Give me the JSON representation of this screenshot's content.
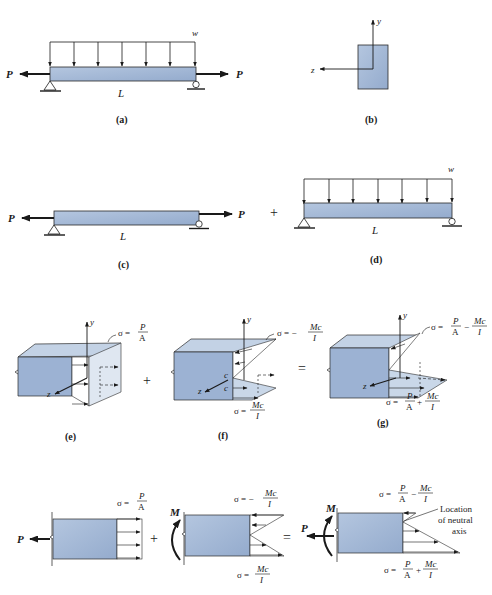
{
  "colors": {
    "beam_fill": "#a9bedb",
    "beam_stroke": "#2a2a2a",
    "face_fill": "#d6e1ee",
    "front_fill": "#9cb2d3",
    "top_fill": "#c3d2e5",
    "line": "#1a1a1a",
    "background": "#ffffff"
  },
  "panels": {
    "a": {
      "caption": "(a)",
      "load_label": "w",
      "force_left": "P",
      "force_right": "P",
      "length_label": "L"
    },
    "b": {
      "caption": "(b)",
      "axis_y": "y",
      "axis_z": "z"
    },
    "c": {
      "caption": "(c)",
      "force_left": "P",
      "force_right": "P",
      "length_label": "L"
    },
    "plus_cd": "+",
    "d": {
      "caption": "(d)",
      "load_label": "w",
      "length_label": "L"
    },
    "e": {
      "caption": "(e)",
      "axis_y": "y",
      "axis_z": "z",
      "stress": {
        "sigma": "σ =",
        "num": "P",
        "den": "A"
      }
    },
    "plus_ef": "+",
    "f": {
      "caption": "(f)",
      "axis_y": "y",
      "axis_z": "z",
      "c_top": "c",
      "c_bottom": "c",
      "stress_top": {
        "sigma": "σ = −",
        "num": "Mc",
        "den": "I"
      },
      "stress_bottom": {
        "sigma": "σ =",
        "num": "Mc",
        "den": "I"
      }
    },
    "equals_fg": "=",
    "g": {
      "caption": "(g)",
      "axis_y": "y",
      "axis_z": "z",
      "stress_top": {
        "sigma": "σ =",
        "num1": "P",
        "den1": "A",
        "op": "−",
        "num2": "Mc",
        "den2": "I"
      },
      "stress_bottom": {
        "sigma": "σ =",
        "num1": "P",
        "den1": "A",
        "op": "+",
        "num2": "Mc",
        "den2": "I"
      }
    },
    "h1": {
      "force": "P",
      "stress": {
        "sigma": "σ =",
        "num": "P",
        "den": "A"
      }
    },
    "plus_h": "+",
    "h2": {
      "moment": "M",
      "stress_top": {
        "sigma": "σ = −",
        "num": "Mc",
        "den": "I"
      },
      "stress_bottom": {
        "sigma": "σ =",
        "num": "Mc",
        "den": "I"
      }
    },
    "equals_h": "=",
    "h3": {
      "moment": "M",
      "force": "P",
      "stress_top": {
        "sigma": "σ =",
        "num1": "P",
        "den1": "A",
        "op": "−",
        "num2": "Mc",
        "den2": "I"
      },
      "stress_bottom": {
        "sigma": "σ =",
        "num1": "P",
        "den1": "A",
        "op": "+",
        "num2": "Mc",
        "den2": "I"
      },
      "annotation": [
        "Location",
        "of neutral",
        "axis"
      ]
    }
  }
}
